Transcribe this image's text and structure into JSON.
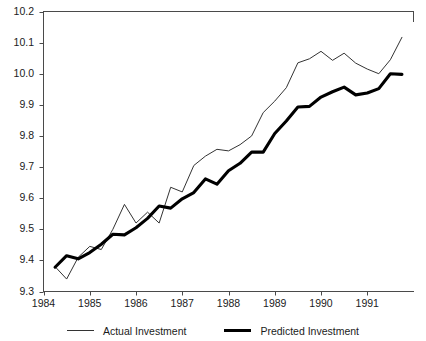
{
  "figure": {
    "clipped_title": "",
    "background_color": "#ffffff"
  },
  "legend": {
    "position": "bottom-center",
    "entries": [
      {
        "label": "Actual Investment",
        "style": "thin",
        "color": "#333333",
        "icon": "line-swatch-icon"
      },
      {
        "label": "Predicted Investment",
        "style": "thick",
        "color": "#000000",
        "icon": "line-swatch-icon"
      }
    ]
  },
  "axes": {
    "y_ticks": [
      "10.2",
      "10.1",
      "10.0",
      "9.9",
      "9.8",
      "9.7",
      "9.6",
      "9.5",
      "9.4",
      "9.3"
    ],
    "x_ticks": [
      "1984",
      "1985",
      "1986",
      "1987",
      "1988",
      "1989",
      "1990",
      "1991"
    ]
  },
  "chart_data": {
    "type": "line",
    "title": "",
    "subtitle": "",
    "xlabel": "",
    "ylabel": "",
    "xlim": [
      1984.0,
      1992.0
    ],
    "ylim": [
      9.3,
      10.2
    ],
    "grid": false,
    "legend_position": "bottom-center",
    "x_tick_values": [
      1984,
      1985,
      1986,
      1987,
      1988,
      1989,
      1990,
      1991
    ],
    "y_tick_values": [
      9.3,
      9.4,
      9.5,
      9.6,
      9.7,
      9.8,
      9.9,
      10.0,
      10.1,
      10.2
    ],
    "x": [
      1984.25,
      1984.5,
      1984.75,
      1985.0,
      1985.25,
      1985.5,
      1985.75,
      1986.0,
      1986.25,
      1986.5,
      1986.75,
      1987.0,
      1987.25,
      1987.5,
      1987.75,
      1988.0,
      1988.25,
      1988.5,
      1988.75,
      1989.0,
      1989.25,
      1989.5,
      1989.75,
      1990.0,
      1990.25,
      1990.5,
      1990.75,
      1991.0,
      1991.25,
      1991.5,
      1991.75
    ],
    "series": [
      {
        "name": "Actual Investment",
        "style": "thin",
        "color": "#333333",
        "values": [
          9.38,
          9.34,
          9.41,
          9.445,
          9.435,
          9.5,
          9.58,
          9.52,
          9.555,
          9.52,
          9.635,
          9.62,
          9.705,
          9.735,
          9.757,
          9.752,
          9.772,
          9.8,
          9.875,
          9.912,
          9.955,
          10.035,
          10.048,
          10.072,
          10.043,
          10.066,
          10.034,
          10.015,
          10.0,
          10.045,
          10.117
        ]
      },
      {
        "name": "Predicted Investment",
        "style": "thick",
        "color": "#000000",
        "values": [
          9.378,
          9.415,
          9.405,
          9.425,
          9.452,
          9.484,
          9.482,
          9.505,
          9.535,
          9.575,
          9.568,
          9.598,
          9.618,
          9.662,
          9.645,
          9.688,
          9.712,
          9.748,
          9.748,
          9.808,
          9.848,
          9.893,
          9.895,
          9.925,
          9.942,
          9.957,
          9.932,
          9.938,
          9.952,
          10.0,
          9.998
        ]
      }
    ]
  }
}
